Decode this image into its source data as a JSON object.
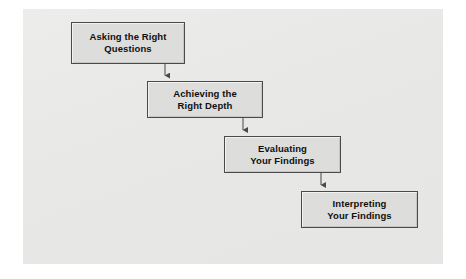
{
  "figure": {
    "type": "flowchart",
    "orientation": "cascading-vertical",
    "panel_color": "#e8e8e6",
    "box_fill_color": "#dddddb",
    "box_border_color": "#4a4a4a",
    "text_color": "#101010",
    "connector_color": "#555555"
  },
  "steps": [
    {
      "id": "step-1",
      "label": "Asking the Right\nQuestions",
      "order": 1
    },
    {
      "id": "step-2",
      "label": "Achieving the\nRight Depth",
      "order": 2
    },
    {
      "id": "step-3",
      "label": "Evaluating\nYour Findings",
      "order": 3
    },
    {
      "id": "step-4",
      "label": "Interpreting\nYour Findings",
      "order": 4
    }
  ],
  "connectors": [
    {
      "id": "connector-1-2",
      "from": "step-1",
      "to": "step-2"
    },
    {
      "id": "connector-2-3",
      "from": "step-2",
      "to": "step-3"
    },
    {
      "id": "connector-3-4",
      "from": "step-3",
      "to": "step-4"
    }
  ]
}
